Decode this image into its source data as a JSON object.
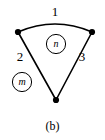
{
  "figure": {
    "caption": "(b)",
    "background_color": "#ffffff",
    "stroke_color": "#000000"
  },
  "diagram": {
    "type": "curvilinear-triangle-graph",
    "vertices": [
      {
        "name": "top-left",
        "x": 18,
        "y": 32
      },
      {
        "name": "top-right",
        "x": 92,
        "y": 32
      },
      {
        "name": "bottom",
        "x": 56,
        "y": 100
      }
    ],
    "edges": [
      {
        "label": "1",
        "shape": "arc",
        "from": "top-left",
        "to": "top-right",
        "bulge": "up"
      },
      {
        "label": "2",
        "shape": "line",
        "from": "top-left",
        "to": "bottom"
      },
      {
        "label": "3",
        "shape": "line",
        "from": "top-right",
        "to": "bottom"
      }
    ],
    "regions": [
      {
        "label": "n",
        "position": "inside",
        "cx": 56,
        "cy": 44,
        "r": 10
      },
      {
        "label": "m",
        "position": "outside",
        "cx": 22,
        "cy": 82,
        "r": 10
      }
    ]
  }
}
